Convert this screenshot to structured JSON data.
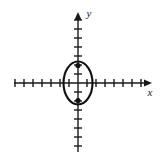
{
  "figure": {
    "name": "ellipse-on-coordinate-plane",
    "width": 162,
    "height": 161,
    "background_color": "#ffffff"
  },
  "axes": {
    "x_label": "x",
    "y_label": "y",
    "origin": {
      "x": 78,
      "y": 83
    },
    "stroke_color": "#1a1a1a",
    "x_axis": {
      "name": "x-axis",
      "start_x": 14,
      "end_x": 152,
      "y": 83,
      "arrow": "right",
      "tick_spacing": 9,
      "ticks_negative": 7,
      "ticks_positive": 7,
      "tick_half_length": 4
    },
    "y_axis": {
      "name": "y-axis",
      "start_y": 152,
      "end_y": 12,
      "x": 78,
      "arrow": "up",
      "tick_spacing": 9,
      "ticks_negative": 7,
      "ticks_positive": 7,
      "tick_half_length": 4
    },
    "x_label_position": {
      "x": 150,
      "y": 96
    },
    "y_label_position": {
      "x": 89,
      "y": 17
    }
  },
  "chart_data": {
    "type": "scatter",
    "title": "",
    "xlabel": "x",
    "ylabel": "y",
    "grid": false,
    "legend": null,
    "xlim": [
      -8,
      8
    ],
    "ylim": [
      -8,
      8
    ],
    "curves": [
      {
        "name": "ellipse",
        "kind": "ellipse",
        "center": [
          0,
          0
        ],
        "semi_axis_x": 1.6,
        "semi_axis_y": 2.4,
        "orientation": "vertical-major",
        "stroke_color": "#111111",
        "stroke_width": 2,
        "fill": "none"
      }
    ],
    "points": [
      {
        "name": "upper-focus",
        "x": 0,
        "y": 1.8,
        "marker": "filled-circle",
        "color": "#111111"
      },
      {
        "name": "lower-focus",
        "x": 0,
        "y": -1.8,
        "marker": "filled-circle",
        "color": "#111111"
      }
    ]
  },
  "ellipse_pixels": {
    "center_x": 78,
    "center_y": 83,
    "radius_x": 14.5,
    "radius_y": 21.5,
    "stroke_color": "#111111",
    "stroke_width": 2.1
  },
  "markers_pixels": [
    {
      "name": "upper-focus-dot",
      "cx": 78,
      "cy": 65.5,
      "r": 2.6,
      "color": "#111111"
    },
    {
      "name": "lower-focus-dot",
      "cx": 78,
      "cy": 100.5,
      "r": 2.6,
      "color": "#111111"
    }
  ]
}
